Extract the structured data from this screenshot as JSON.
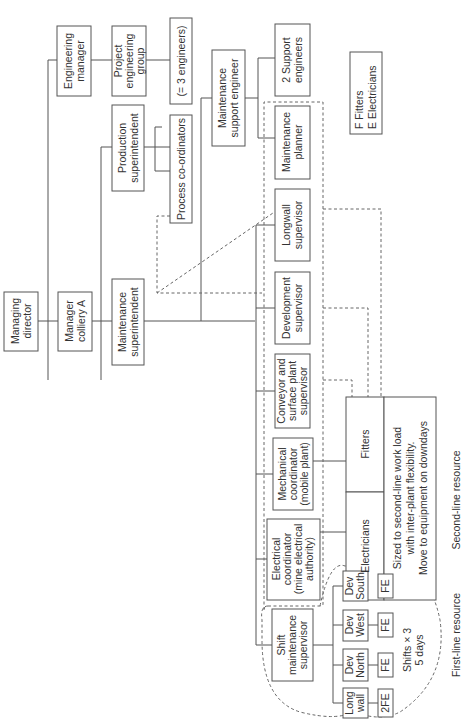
{
  "diagram": {
    "type": "organization-chart",
    "orientation": "rotated 90 degrees counter-clockwise",
    "nodes": {
      "managing_director": [
        "Managing",
        "director"
      ],
      "manager_colliery": [
        "Manager",
        "colliery A"
      ],
      "maintenance_superintendent": [
        "Maintenance",
        "superintendent"
      ],
      "engineering_manager": [
        "Engineering",
        "manager"
      ],
      "project_engineering_group": [
        "Project",
        "engineering",
        "group"
      ],
      "three_engineers": [
        "(= 3 engineers)"
      ],
      "production_superintendent": [
        "Production",
        "superintendent"
      ],
      "process_coordinators": [
        "Process co-ordinators"
      ],
      "maintenance_support_engineer": [
        "Maintenance",
        "support engineer"
      ],
      "support_engineers": [
        "2 Support",
        "engineers"
      ],
      "maintenance_planner": [
        "Maintenance",
        "planner"
      ],
      "longwall_supervisor": [
        "Longwall",
        "supervisor"
      ],
      "development_supervisor": [
        "Development",
        "supervisor"
      ],
      "conveyor_supervisor": [
        "Conveyor and",
        "surface plant",
        "supervisor"
      ],
      "mechanical_coordinator": [
        "Mechanical",
        "coordinator",
        "(mobile plant)"
      ],
      "electrical_coordinator": [
        "Electrical",
        "coordinator",
        "(mine electrical",
        "authority)"
      ],
      "shift_supervisor": [
        "Shift",
        "maintenance",
        "supervisor"
      ],
      "fitters": [
        "Fitters"
      ],
      "electricians": [
        "Electricians"
      ],
      "second_line_note": [
        "Sized to second-line work load",
        "with inter-plant flexibility.",
        "Move to equipment on downdays"
      ],
      "dev_south": [
        "Dev",
        "South"
      ],
      "dev_west": [
        "Dev",
        "West"
      ],
      "dev_north": [
        "Dev",
        "North"
      ],
      "long_wall": [
        "Long",
        "wall"
      ],
      "crew_dev_south": [
        "FE"
      ],
      "crew_dev_west": [
        "FE"
      ],
      "crew_dev_north": [
        "FE"
      ],
      "crew_long_wall": [
        "2FE"
      ]
    },
    "shifts_note": [
      "Shifts × 3",
      "5 days"
    ],
    "legend": [
      "F   Fitters",
      "E   Electricians"
    ],
    "first_line_label": "First-line resource",
    "second_line_label": "Second-line resource"
  }
}
